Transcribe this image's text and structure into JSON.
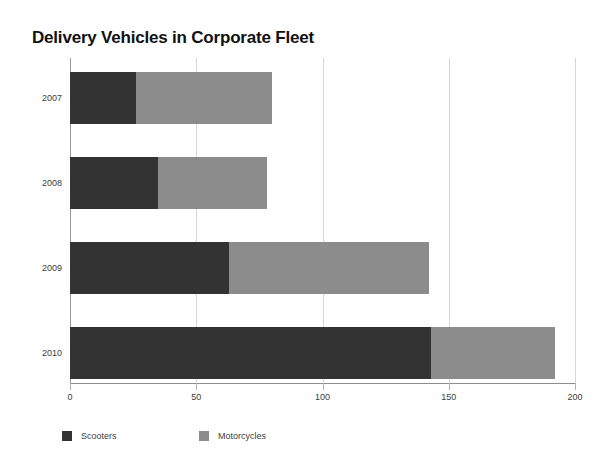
{
  "chart_data": {
    "type": "bar",
    "orientation": "horizontal",
    "stacked": true,
    "title": "Delivery Vehicles in Corporate Fleet",
    "xlabel": "",
    "ylabel": "",
    "categories": [
      "2007",
      "2008",
      "2009",
      "2010"
    ],
    "series": [
      {
        "name": "Scooters",
        "color": "#333333",
        "values": [
          26,
          35,
          63,
          143
        ]
      },
      {
        "name": "Motorcycles",
        "color": "#8c8c8c",
        "values": [
          54,
          43,
          79,
          49
        ]
      }
    ],
    "totals": [
      80,
      78,
      142,
      192
    ],
    "xlim": [
      0,
      200
    ],
    "xticks": [
      0,
      50,
      100,
      150,
      200
    ],
    "xtick_labels": [
      "0",
      "50",
      "100",
      "150",
      "200"
    ],
    "grid": true,
    "grid_axis": "x",
    "legend": {
      "position": "bottom-left",
      "entries": [
        {
          "label": "Scooters",
          "color": "#333333"
        },
        {
          "label": "Motorcycles",
          "color": "#8c8c8c"
        }
      ]
    },
    "colors": {
      "background": "#ffffff",
      "gridline": "#d6d6d6",
      "axis": "#8d8d8d",
      "text": "#3d3d3d",
      "title": "#111111"
    }
  }
}
